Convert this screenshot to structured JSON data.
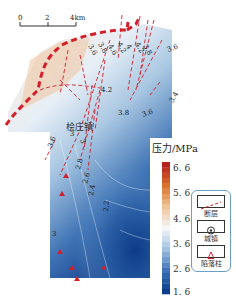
{
  "scale_bar": {
    "ticks": [
      "0",
      "2",
      "4km"
    ]
  },
  "town": {
    "name": "桧庄镇"
  },
  "contour_labels": [
    "3.6",
    "3.8",
    "4.6",
    "4.2",
    "4",
    "4.2",
    "3.8",
    "3.6",
    "4.2",
    "3.8",
    "3.6",
    "3.4",
    "3.6",
    "3",
    "3",
    "2.8",
    "2.6",
    "2.4",
    "2.2",
    "3"
  ],
  "colorbar": {
    "title": "压力/MPa",
    "ticks": [
      "6. 6",
      "5. 6",
      "4. 6",
      "3. 6",
      "2. 6",
      "1. 6"
    ],
    "min": 1.6,
    "max": 6.6,
    "colors": [
      "#0b3d8c",
      "#3f73b6",
      "#9fc0df",
      "#f4f6f9",
      "#f0c49a",
      "#d9732c",
      "#b3221c"
    ]
  },
  "legend": {
    "items": [
      {
        "label": "断层",
        "icon": "fault-line-icon"
      },
      {
        "label": "城镇",
        "icon": "town-icon"
      },
      {
        "label": "陷落柱",
        "icon": "collapse-column-icon"
      }
    ]
  },
  "colors": {
    "fault": "#d21f2a",
    "boundary": "#d21f2a",
    "collapse": "#d21f2a"
  }
}
